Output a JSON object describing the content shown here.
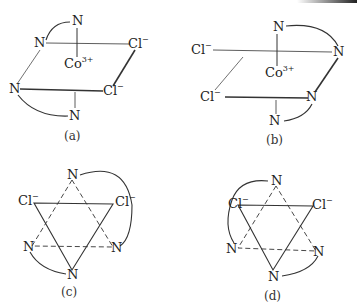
{
  "panels": [
    {
      "id": "a",
      "caption": "(a)",
      "center": "Co",
      "charge": "3+",
      "atoms": [
        {
          "text": "N",
          "x": 72,
          "y": 14
        },
        {
          "text": "N",
          "x": 34,
          "y": 36
        },
        {
          "text": "Cl",
          "sup": "−",
          "x": 128,
          "y": 37
        },
        {
          "text": "Co",
          "sup": "3+",
          "x": 64,
          "y": 57
        },
        {
          "text": "N",
          "x": 9,
          "y": 82
        },
        {
          "text": "Cl",
          "sup": "−",
          "x": 103,
          "y": 84
        },
        {
          "text": "N",
          "x": 69,
          "y": 109
        }
      ]
    },
    {
      "id": "b",
      "caption": "(b)",
      "center": "Co",
      "charge": "3+",
      "atoms": [
        {
          "text": "N",
          "x": 273,
          "y": 20
        },
        {
          "text": "Cl",
          "sup": "−",
          "x": 191,
          "y": 43
        },
        {
          "text": "N",
          "x": 333,
          "y": 45
        },
        {
          "text": "Co",
          "sup": "3+",
          "x": 265,
          "y": 66
        },
        {
          "text": "Cl",
          "sup": "−",
          "x": 200,
          "y": 90
        },
        {
          "text": "N",
          "x": 306,
          "y": 90
        },
        {
          "text": "N",
          "x": 269,
          "y": 114
        }
      ]
    },
    {
      "id": "c",
      "caption": "(c)",
      "atoms": [
        {
          "text": "N",
          "x": 67,
          "y": 168
        },
        {
          "text": "Cl",
          "sup": "−",
          "x": 18,
          "y": 194
        },
        {
          "text": "Cl",
          "sup": "−",
          "x": 115,
          "y": 195
        },
        {
          "text": "N",
          "x": 23,
          "y": 240
        },
        {
          "text": "N",
          "x": 111,
          "y": 241
        },
        {
          "text": "N",
          "x": 67,
          "y": 268
        }
      ]
    },
    {
      "id": "d",
      "caption": "(d)",
      "atoms": [
        {
          "text": "N",
          "x": 271,
          "y": 174
        },
        {
          "text": "Cl",
          "sup": "−",
          "x": 228,
          "y": 197
        },
        {
          "text": "Cl",
          "sup": "−",
          "x": 312,
          "y": 198
        },
        {
          "text": "N",
          "x": 226,
          "y": 242
        },
        {
          "text": "N",
          "x": 313,
          "y": 245
        },
        {
          "text": "N",
          "x": 268,
          "y": 270
        }
      ]
    }
  ]
}
